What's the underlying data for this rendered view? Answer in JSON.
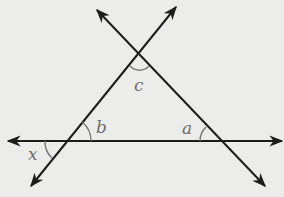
{
  "diagram": {
    "colors": {
      "background": "#ececea",
      "line": "#1c1c1c",
      "arc": "#7a7a7a",
      "label": "#6e6e6e"
    },
    "lines": [
      {
        "name": "horizontal-line",
        "x1": 8,
        "y1": 141,
        "x2": 282,
        "y2": 141
      },
      {
        "name": "rising-line",
        "x1": 31,
        "y1": 186,
        "x2": 176,
        "y2": 7
      },
      {
        "name": "falling-line",
        "x1": 97,
        "y1": 10,
        "x2": 265,
        "y2": 186
      }
    ],
    "angles": [
      {
        "name": "angle-c",
        "label": "c",
        "x": 134,
        "y": 91
      },
      {
        "name": "angle-b",
        "label": "b",
        "x": 96,
        "y": 133
      },
      {
        "name": "angle-a",
        "label": "a",
        "x": 182,
        "y": 134
      },
      {
        "name": "angle-x",
        "label": "x",
        "x": 28,
        "y": 160
      }
    ]
  }
}
